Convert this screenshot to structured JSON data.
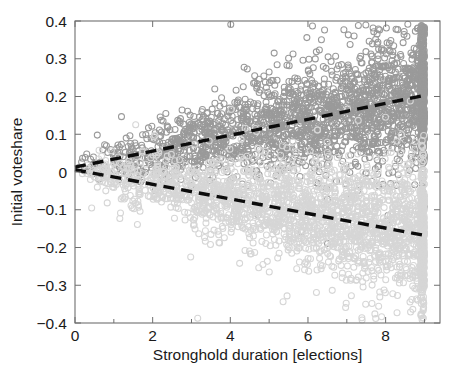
{
  "chart_data": {
    "type": "scatter",
    "title": "",
    "xlabel": "Stronghold duration [elections]",
    "ylabel": "Initial voteshare",
    "xlim": [
      0,
      9.4
    ],
    "ylim": [
      -0.4,
      0.4
    ],
    "xticks": [
      0,
      2,
      4,
      6,
      8
    ],
    "xticklabels": [
      "0",
      "2",
      "4",
      "6",
      "8"
    ],
    "xminorticks": [
      1,
      3,
      5,
      7,
      9
    ],
    "yticks": [
      -0.4,
      -0.3,
      -0.2,
      -0.1,
      0,
      0.1,
      0.2,
      0.3,
      0.4
    ],
    "yticklabels": [
      "-0.4",
      "-0.3",
      "-0.2",
      "-0.1",
      "0",
      "0.1",
      "0.2",
      "0.3",
      "0.4"
    ],
    "grid": false,
    "legend": "none",
    "marker_style": "open-circle",
    "marker_radius_px": 3.0,
    "series": [
      {
        "name": "upper-cloud",
        "color": "#9a9a9a",
        "n_points": 2400,
        "description": "Dark grey open circles, positive-sloping cloud",
        "x_range": [
          0,
          9
        ],
        "y_at_x0": 0.012,
        "y_at_x9": 0.205,
        "spread_at_x0": 0.018,
        "spread_at_x9": 0.085
      },
      {
        "name": "lower-cloud",
        "color": "#d6d6d6",
        "n_points": 2400,
        "description": "Light grey open circles, negative-sloping cloud",
        "x_range": [
          0,
          9
        ],
        "y_at_x0": 0.008,
        "y_at_x9": -0.168,
        "spread_at_x0": 0.018,
        "spread_at_x9": 0.085
      }
    ],
    "trendlines": [
      {
        "name": "upper-fit",
        "style": "dashed",
        "color": "#0c0c0c",
        "x": [
          0,
          9
        ],
        "y": [
          0.013,
          0.203
        ],
        "slope": 0.0211,
        "intercept": 0.013
      },
      {
        "name": "lower-fit",
        "style": "dashed",
        "color": "#0c0c0c",
        "x": [
          0,
          9
        ],
        "y": [
          0.006,
          -0.168
        ],
        "slope": -0.0193,
        "intercept": 0.006
      }
    ]
  },
  "axes": {
    "x_title": "Stronghold duration [elections]",
    "y_title": "Initial voteshare"
  }
}
